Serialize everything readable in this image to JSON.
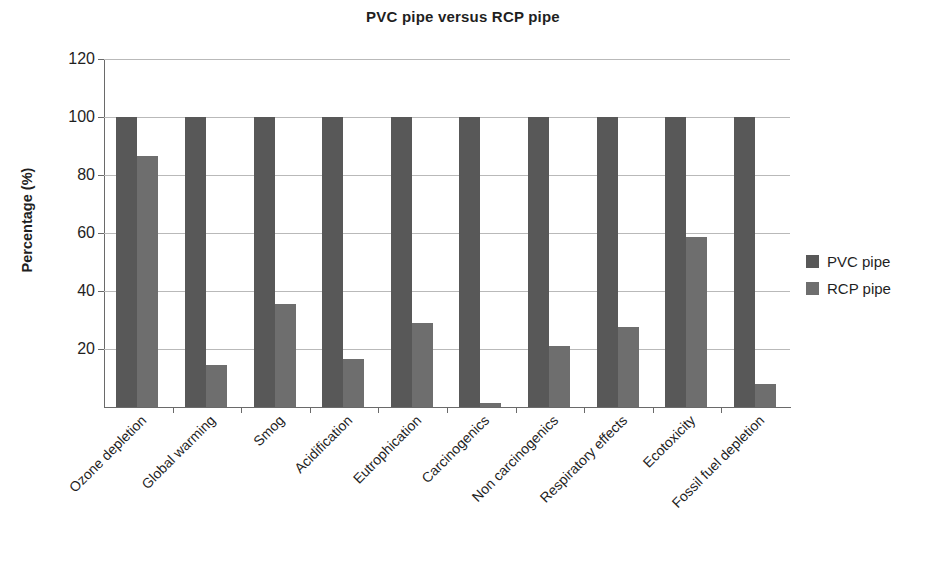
{
  "chart_data": {
    "type": "bar",
    "title": "PVC pipe versus RCP pipe",
    "xlabel": "",
    "ylabel": "Percentage (%)",
    "ylim": [
      0,
      120
    ],
    "ytick_labels": [
      "120",
      "100",
      "80",
      "60",
      "40",
      "20"
    ],
    "yticks": [
      120,
      100,
      80,
      60,
      40,
      20
    ],
    "grid": true,
    "legend_position": "right",
    "categories": [
      "Ozone depletion",
      "Global warming",
      "Smog",
      "Acidification",
      "Eutrophication",
      "Carcinogenics",
      "Non carcinogenics",
      "Respiratory effects",
      "Ecotoxicity",
      "Fossil fuel depletion"
    ],
    "series": [
      {
        "name": "PVC pipe",
        "color": "#585858",
        "values": [
          100,
          100,
          100,
          100,
          100,
          100,
          100,
          100,
          100,
          100
        ]
      },
      {
        "name": "RCP pipe",
        "color": "#6e6e6e",
        "values": [
          86.5,
          14.5,
          35.5,
          16.5,
          29,
          1.5,
          21,
          27.5,
          58.5,
          8
        ]
      }
    ]
  },
  "legend": {
    "items": [
      {
        "label": "PVC pipe",
        "swatch": "pvc"
      },
      {
        "label": "RCP pipe",
        "swatch": "rcp"
      }
    ]
  }
}
